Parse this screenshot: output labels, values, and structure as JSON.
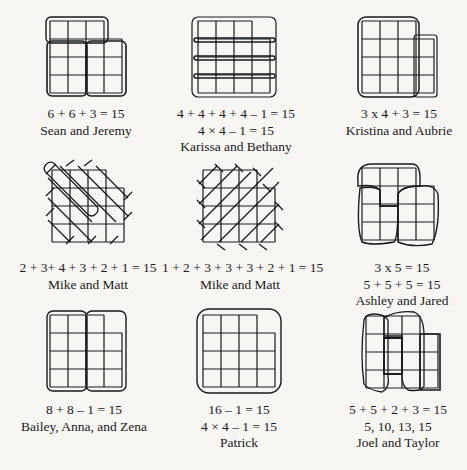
{
  "figures": [
    {
      "id": "sean-jeremy",
      "equations": [
        "6 + 6 + 3 = 15"
      ],
      "names": "Sean and Jeremy",
      "missing_cell": "top-right"
    },
    {
      "id": "karissa-bethany",
      "equations": [
        "4 + 4 + 4 + 4 – 1 = 15",
        "4 × 4 – 1 = 15"
      ],
      "names": "Karissa and Bethany",
      "missing_cell": "top-right"
    },
    {
      "id": "kristina-aubrie",
      "equations": [
        "3 x 4 + 3 = 15"
      ],
      "names": "Kristina and Aubrie",
      "missing_cell": "top-right"
    },
    {
      "id": "mike-matt-1",
      "equations": [
        "2 + 3+ 4 + 3 + 2 + 1 = 15"
      ],
      "names": "Mike and Matt",
      "missing_cell": "top-right"
    },
    {
      "id": "mike-matt-2",
      "equations": [
        "1 + 2 + 3 + 3 + 3 + 2 + 1 = 15"
      ],
      "names": "Mike and Matt",
      "missing_cell": "top-right"
    },
    {
      "id": "ashley-jared",
      "equations": [
        "3 x 5 = 15",
        "5 + 5 + 5 = 15"
      ],
      "names": "Ashley and Jared",
      "missing_cell": "top-right"
    },
    {
      "id": "bailey-anna-zena",
      "equations": [
        "8 + 8 – 1 = 15"
      ],
      "names": "Bailey, Anna, and Zena",
      "missing_cell": "top-right"
    },
    {
      "id": "patrick",
      "equations": [
        "16 – 1 = 15",
        "4 × 4 – 1 = 15"
      ],
      "names": "Patrick",
      "missing_cell": "top-right"
    },
    {
      "id": "joel-taylor",
      "equations": [
        "5 + 5 + 2 + 3 = 15",
        "5, 10, 13, 15"
      ],
      "names": "Joel and Taylor",
      "missing_cell": "top-right"
    }
  ],
  "colors": {
    "background": "#f7f6f3",
    "ink": "#1a1a1a"
  }
}
